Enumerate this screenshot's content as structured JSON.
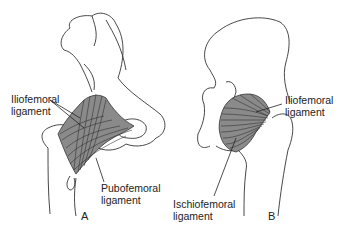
{
  "figure": {
    "panels": [
      {
        "id": "A",
        "label": "A",
        "view": "anterior",
        "labels": [
          {
            "line1": "Iliofemoral",
            "line2": "ligament"
          },
          {
            "line1": "Pubofemoral",
            "line2": "ligament"
          }
        ]
      },
      {
        "id": "B",
        "label": "B",
        "view": "posterior",
        "labels": [
          {
            "line1": "Iliofemoral",
            "line2": "ligament"
          },
          {
            "line1": "Ischiofemoral",
            "line2": "ligament"
          }
        ]
      }
    ],
    "colors": {
      "background": "#ffffff",
      "line": "#333333",
      "ligament_fill": "#8a8a8a"
    }
  }
}
